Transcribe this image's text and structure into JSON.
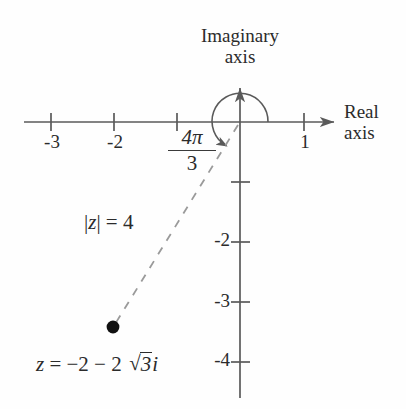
{
  "figure": {
    "type": "complex-plane-diagram",
    "axes": {
      "imaginary_axis_label_line1": "Imaginary",
      "imaginary_axis_label_line2": "axis",
      "real_axis_label_line1": "Real",
      "real_axis_label_line2": "axis",
      "x_ticks": [
        "-3",
        "-2",
        "1"
      ],
      "y_ticks": [
        "-2",
        "-3",
        "-4"
      ],
      "x_tick_values": [
        -3,
        -2,
        1
      ],
      "y_tick_values": [
        -2,
        -3,
        -4
      ],
      "origin_px": [
        240,
        122
      ],
      "unit_px_x": 63,
      "unit_px_y": 60,
      "grid": false
    },
    "angle": {
      "numerator": "4π",
      "denominator": "3",
      "value_radians": "4π/3",
      "degrees": 240,
      "arc_radius_px": 28,
      "arc_direction": "counterclockwise"
    },
    "modulus": {
      "label_prefix": "|",
      "label_var": "z",
      "label_mid": "| = ",
      "label_value": "4",
      "value": 4
    },
    "point": {
      "label_lhs": "z",
      "label_eq": " = ",
      "label_real": "−2 − 2",
      "label_radicand": "3",
      "label_imag_unit": "i",
      "coordinates": [
        -2,
        -3.4641
      ],
      "pixel": [
        113,
        327
      ],
      "radius_px": 6
    },
    "style": {
      "stroke": "#5a5a5a",
      "ink": "#2b2b2b",
      "dash_stroke": "#8a8a8a",
      "background": "#fefefe"
    }
  }
}
